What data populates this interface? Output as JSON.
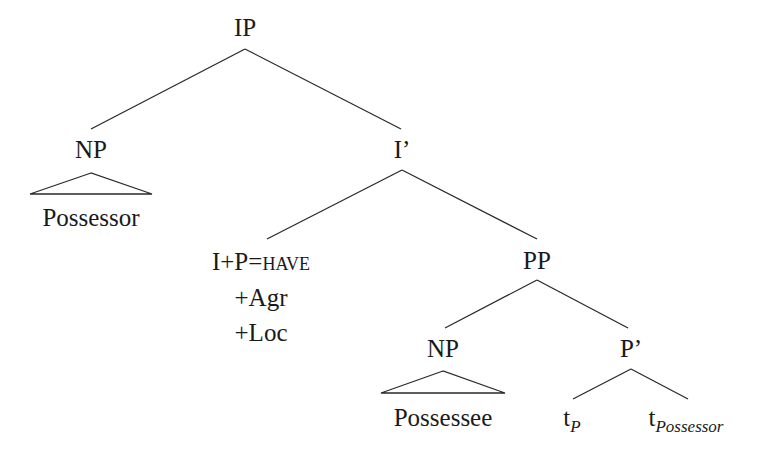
{
  "tree": {
    "root": {
      "label": "IP"
    },
    "subject_np": {
      "label": "NP",
      "content": "Possessor"
    },
    "i_bar": {
      "label": "I’"
    },
    "head": {
      "label_prefix": "I+P=",
      "label_smallcaps": "have",
      "features": [
        "+Agr",
        "+Loc"
      ]
    },
    "pp": {
      "label": "PP"
    },
    "object_np": {
      "label": "NP",
      "content": "Possessee"
    },
    "p_bar": {
      "label": "P’"
    },
    "traces": [
      {
        "base": "t",
        "subscript": "P"
      },
      {
        "base": "t",
        "subscript": "Possessor"
      }
    ]
  }
}
